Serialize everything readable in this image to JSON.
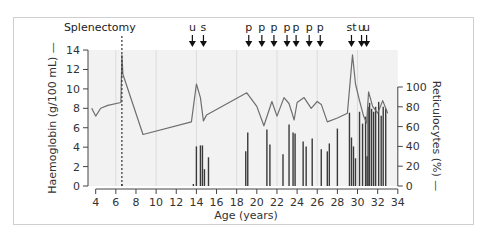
{
  "chart_data": {
    "type": "line+bar",
    "title": "",
    "xlabel": "Age (years)",
    "ylabel_left": "Haemoglobin (g/100 mL) —",
    "ylabel_right": "Reticulocytes (%) —",
    "xlim": [
      4,
      34
    ],
    "ylim_left": [
      0,
      14
    ],
    "ylim_right": [
      0,
      100
    ],
    "x_ticks": [
      4,
      6,
      8,
      10,
      12,
      14,
      16,
      18,
      20,
      22,
      24,
      26,
      28,
      30,
      32,
      34
    ],
    "y_left_ticks": [
      0,
      2,
      4,
      6,
      8,
      10,
      12,
      14
    ],
    "y_right_ticks": [
      0,
      20,
      40,
      60,
      80,
      100
    ],
    "grid": "vertical lines every 4 years on shaded background",
    "annotations": {
      "splenectomy": {
        "label": "Splenectomy",
        "age": 6.6
      },
      "arrows": [
        {
          "label": "u",
          "age": 13.6
        },
        {
          "label": "s",
          "age": 14.7
        },
        {
          "label": "p",
          "age": 19.2
        },
        {
          "label": "p",
          "age": 20.5
        },
        {
          "label": "p",
          "age": 21.7
        },
        {
          "label": "p",
          "age": 23.0
        },
        {
          "label": "p",
          "age": 23.9
        },
        {
          "label": "p",
          "age": 25.2
        },
        {
          "label": "p",
          "age": 26.3
        },
        {
          "label": "st",
          "age": 29.4
        },
        {
          "label": "u",
          "age": 30.4
        },
        {
          "label": "u",
          "age": 30.9
        }
      ]
    },
    "series": [
      {
        "name": "Haemoglobin (g/100 mL)",
        "type": "line",
        "axis": "left",
        "x": [
          3.6,
          4.0,
          4.5,
          5.2,
          6.5,
          6.6,
          6.7,
          8.7,
          13.5,
          14.0,
          14.4,
          14.7,
          15.0,
          19.0,
          20.0,
          20.7,
          21.5,
          22.0,
          22.7,
          23.2,
          23.5,
          23.7,
          24.0,
          24.7,
          25.4,
          26.0,
          26.4,
          27.0,
          28.0,
          29.0,
          29.5,
          29.8,
          30.2,
          30.6,
          30.9,
          31.1,
          31.5,
          32.0,
          32.5,
          33.0
        ],
        "values": [
          8.0,
          7.2,
          8.0,
          8.3,
          8.6,
          13.5,
          11.5,
          5.3,
          6.6,
          10.5,
          9.1,
          6.7,
          7.3,
          9.6,
          8.2,
          6.2,
          8.7,
          7.2,
          9.1,
          8.5,
          7.5,
          6.8,
          8.6,
          9.1,
          8.0,
          8.7,
          8.4,
          6.6,
          7.0,
          7.5,
          13.5,
          10.5,
          8.8,
          7.2,
          6.5,
          9.7,
          8.2,
          7.5,
          8.8,
          7.5
        ]
      },
      {
        "name": "Reticulocytes (%)",
        "type": "bar",
        "axis": "right",
        "x": [
          6.6,
          13.7,
          14.0,
          14.4,
          14.6,
          14.8,
          15.2,
          18.9,
          19.1,
          21.0,
          21.3,
          22.6,
          23.2,
          23.6,
          23.8,
          24.6,
          24.9,
          25.5,
          26.4,
          27.0,
          27.2,
          28.0,
          29.2,
          29.4,
          29.6,
          29.8,
          30.2,
          30.5,
          30.8,
          30.95,
          31.05,
          31.2,
          31.4,
          31.6,
          31.8,
          32.1,
          32.35,
          32.55,
          32.8
        ],
        "values": [
          2,
          2,
          40,
          41,
          41,
          17,
          29,
          35,
          54,
          57,
          42,
          32,
          62,
          54,
          53,
          45,
          40,
          48,
          37,
          35,
          43,
          58,
          74,
          49,
          40,
          28,
          75,
          63,
          70,
          30,
          80,
          84,
          78,
          75,
          80,
          85,
          71,
          80,
          78
        ]
      }
    ]
  },
  "labels": {
    "splenectomy": "Splenectomy",
    "x_axis_title": "Age (years)",
    "y_left_title": "Haemoglobin (g/100 mL) —",
    "y_right_title": "Reticulocytes (%) —"
  },
  "colors": {
    "plot_background": "#f2f2f2",
    "grid": "#dcdcdc",
    "line": "#6e6e6e",
    "bars": "#3a3a3a",
    "axis": "#444444",
    "text": "#333333",
    "frame": "#cfcfcf"
  }
}
